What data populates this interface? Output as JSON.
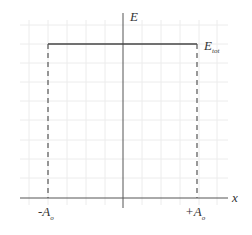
{
  "diagram": {
    "axes": {
      "x_label": "x",
      "y_label": "E"
    },
    "level": {
      "label_main": "E",
      "label_sub": "tot"
    },
    "ticks": {
      "left_main": "-A",
      "left_sub": "o",
      "right_main": "+A",
      "right_sub": "o"
    },
    "colors": {
      "grid": "#ececec",
      "axis": "#555555",
      "level_line": "#444444",
      "dashed": "#555555"
    }
  }
}
